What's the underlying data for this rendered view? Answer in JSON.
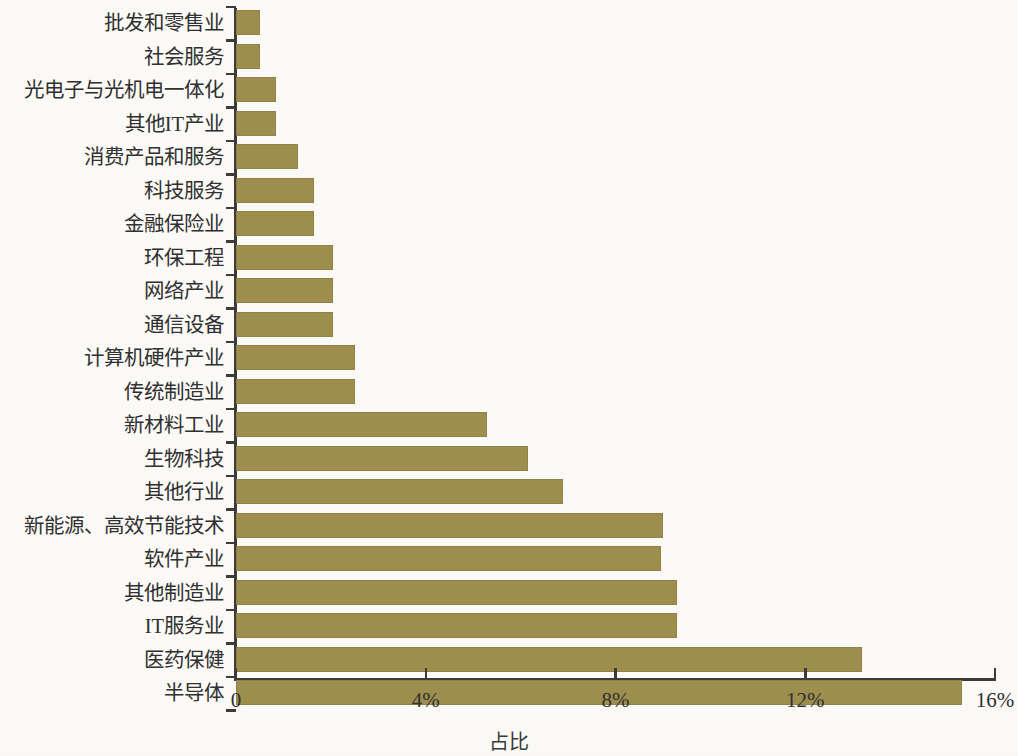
{
  "chart_data": {
    "type": "bar",
    "orientation": "horizontal",
    "title": "",
    "xlabel": "占比",
    "ylabel": "",
    "xlim": [
      0,
      16
    ],
    "xunit": "%",
    "xticks": [
      0,
      4,
      8,
      12,
      16
    ],
    "xtick_labels": [
      "0",
      "4%",
      "8%",
      "12%",
      "16%"
    ],
    "grid": false,
    "legend": null,
    "bar_color": "#9e8e4d",
    "axis_color": "#3c3a35",
    "background_color": "#fbfaf7",
    "categories": [
      "批发和零售业",
      "社会服务",
      "光电子与光机电一体化",
      "其他IT产业",
      "消费产品和服务",
      "科技服务",
      "金融保险业",
      "环保工程",
      "网络产业",
      "通信设备",
      "计算机硬件产业",
      "传统制造业",
      "新材料工业",
      "生物科技",
      "其他行业",
      "新能源、高效节能技术",
      "软件产业",
      "其他制造业",
      "IT服务业",
      "医药保健",
      "半导体"
    ],
    "values": [
      0.5,
      0.5,
      0.85,
      0.85,
      1.3,
      1.65,
      1.65,
      2.05,
      2.05,
      2.05,
      2.5,
      2.5,
      5.3,
      6.15,
      6.9,
      9.0,
      8.95,
      9.3,
      9.3,
      13.2,
      15.3
    ]
  }
}
